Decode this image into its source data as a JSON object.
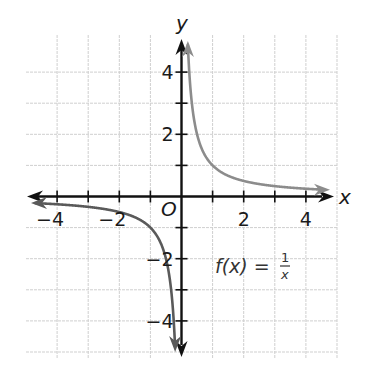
{
  "chart_data": {
    "type": "line",
    "title": "",
    "function_label": "f(x) = 1/x",
    "function_label_parts": {
      "lhs": "f(x) =",
      "numerator": "1",
      "denominator": "x"
    },
    "xlabel": "x",
    "ylabel": "y",
    "origin_label": "O",
    "xlim": [
      -5,
      5
    ],
    "ylim": [
      -5,
      5
    ],
    "grid": true,
    "grid_step": 1,
    "x_tick_labels": [
      "−4",
      "−2",
      "2",
      "4"
    ],
    "x_tick_values": [
      -4,
      -2,
      2,
      4
    ],
    "y_tick_labels": [
      "4",
      "2",
      "−2",
      "−4"
    ],
    "y_tick_values": [
      4,
      2,
      -2,
      -4
    ],
    "series": [
      {
        "name": "f(x) = 1/x (x > 0)",
        "color": "#8c8c8c",
        "x": [
          0.21,
          0.25,
          0.3,
          0.4,
          0.5,
          0.75,
          1,
          1.5,
          2,
          2.5,
          3,
          3.5,
          4,
          4.5
        ],
        "y": [
          4.8,
          4.0,
          3.33,
          2.5,
          2.0,
          1.33,
          1.0,
          0.67,
          0.5,
          0.4,
          0.33,
          0.29,
          0.25,
          0.22
        ]
      },
      {
        "name": "f(x) = 1/x (x < 0)",
        "color": "#5a5a5a",
        "x": [
          -4.8,
          -4,
          -3.5,
          -3,
          -2.5,
          -2,
          -1.5,
          -1,
          -0.75,
          -0.5,
          -0.4,
          -0.3,
          -0.25,
          -0.21
        ],
        "y": [
          -0.21,
          -0.25,
          -0.29,
          -0.33,
          -0.4,
          -0.5,
          -0.67,
          -1.0,
          -1.33,
          -2.0,
          -2.5,
          -3.33,
          -4.0,
          -4.8
        ]
      }
    ],
    "asymptotes": {
      "vertical": 0,
      "horizontal": 0
    }
  },
  "colors": {
    "axis": "#111111",
    "grid": "#cfcfcf",
    "curve_positive": "#8c8c8c",
    "curve_negative": "#5a5a5a"
  }
}
